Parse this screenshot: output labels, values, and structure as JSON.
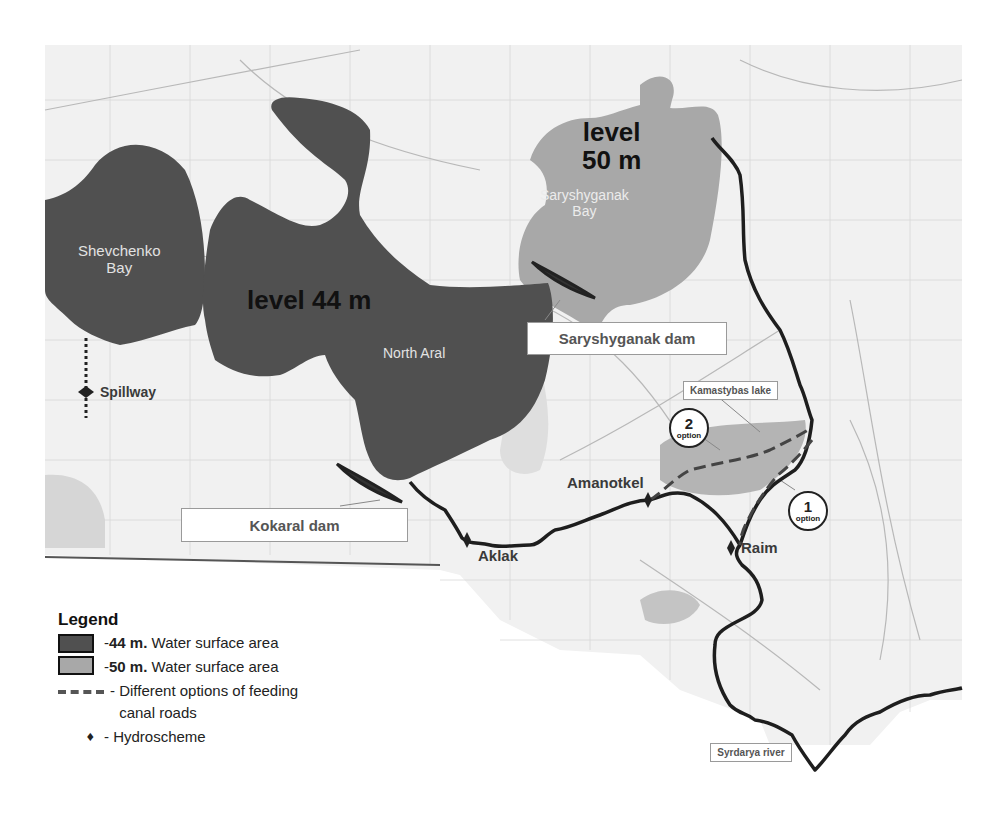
{
  "map": {
    "colors": {
      "water_44m": "#505050",
      "water_50m": "#a8a8a8",
      "land": "#f2f2f2",
      "river": "#1e1e1e",
      "canal": "#555555"
    },
    "labels": {
      "level_44": "level 44 m",
      "level_50_line1": "level",
      "level_50_line2": "50 m",
      "shevchenko_line1": "Shevchenko",
      "shevchenko_line2": "Bay",
      "saryshyganak_bay_line1": "Saryshyganak",
      "saryshyganak_bay_line2": "Bay",
      "north_aral": "North Aral",
      "spillway": "Spillway",
      "saryshyganak_dam": "Saryshyganak dam",
      "kokaral_dam": "Kokaral dam",
      "kamastybas_lake": "Kamastybas lake",
      "amanotkel": "Amanotkel",
      "aklak": "Aklak",
      "raim": "Raim",
      "syrdarya_river": "Syrdarya river"
    },
    "options": [
      {
        "number": "2",
        "word": "option"
      },
      {
        "number": "1",
        "word": "option"
      }
    ]
  },
  "legend": {
    "title": "Legend",
    "items": [
      {
        "symbol": "dark-swatch",
        "bold": "44 m.",
        "text": " Water surface area"
      },
      {
        "symbol": "light-swatch",
        "bold": "50 m.",
        "text": " Water surface area"
      },
      {
        "symbol": "dashed-line",
        "text_line1": "Different options of feeding",
        "text_line2": "canal roads"
      },
      {
        "symbol": "hydroscheme",
        "text": "Hydroscheme"
      }
    ]
  }
}
